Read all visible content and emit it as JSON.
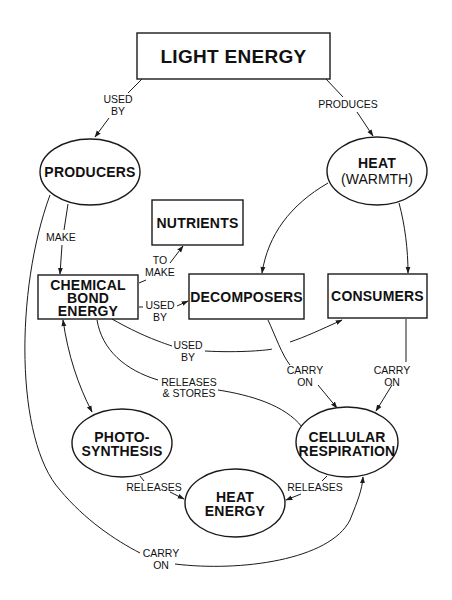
{
  "diagram": {
    "nodes": {
      "light_energy": {
        "lines": [
          "LIGHT ENERGY"
        ],
        "shape": "rect"
      },
      "producers": {
        "lines": [
          "PRODUCERS"
        ],
        "shape": "ellipse"
      },
      "heat_warmth": {
        "lines": [
          "HEAT",
          "(WARMTH)"
        ],
        "shape": "ellipse"
      },
      "nutrients": {
        "lines": [
          "NUTRIENTS"
        ],
        "shape": "rect"
      },
      "chemical_bond_energy": {
        "lines": [
          "CHEMICAL",
          "BOND",
          "ENERGY"
        ],
        "shape": "rect"
      },
      "decomposers": {
        "lines": [
          "DECOMPOSERS"
        ],
        "shape": "rect"
      },
      "consumers": {
        "lines": [
          "CONSUMERS"
        ],
        "shape": "rect"
      },
      "photosynthesis": {
        "lines": [
          "PHOTO-",
          "SYNTHESIS"
        ],
        "shape": "ellipse"
      },
      "cellular_respiration": {
        "lines": [
          "CELLULAR",
          "RESPIRATION"
        ],
        "shape": "ellipse"
      },
      "heat_energy": {
        "lines": [
          "HEAT",
          "ENERGY"
        ],
        "shape": "ellipse"
      }
    },
    "edges": [
      {
        "from": "light_energy",
        "to": "producers",
        "label": [
          "USED",
          "BY"
        ]
      },
      {
        "from": "light_energy",
        "to": "heat_warmth",
        "label": [
          "PRODUCES"
        ]
      },
      {
        "from": "producers",
        "to": "chemical_bond_energy",
        "label": [
          "MAKE"
        ]
      },
      {
        "from": "chemical_bond_energy",
        "to": "nutrients",
        "label": [
          "TO",
          "MAKE"
        ]
      },
      {
        "from": "chemical_bond_energy",
        "to": "decomposers",
        "label": [
          "USED",
          "BY"
        ]
      },
      {
        "from": "chemical_bond_energy",
        "to": "consumers",
        "label": [
          "USED",
          "BY"
        ]
      },
      {
        "from": "heat_warmth",
        "to": "decomposers",
        "label": []
      },
      {
        "from": "heat_warmth",
        "to": "consumers",
        "label": []
      },
      {
        "from": "decomposers",
        "to": "cellular_respiration",
        "label": [
          "CARRY",
          "ON"
        ]
      },
      {
        "from": "consumers",
        "to": "cellular_respiration",
        "label": [
          "CARRY",
          "ON"
        ]
      },
      {
        "from": "cellular_respiration",
        "to": "chemical_bond_energy",
        "label": [
          "RELEASES",
          "& STORES"
        ]
      },
      {
        "from": "chemical_bond_energy",
        "to": "photosynthesis",
        "label": [],
        "bidirectional": true
      },
      {
        "from": "photosynthesis",
        "to": "heat_energy",
        "label": [
          "RELEASES"
        ]
      },
      {
        "from": "cellular_respiration",
        "to": "heat_energy",
        "label": [
          "RELEASES"
        ]
      },
      {
        "from": "producers",
        "to": "cellular_respiration",
        "label": [
          "CARRY",
          "ON"
        ]
      }
    ]
  },
  "labels": {
    "light_energy": "LIGHT ENERGY",
    "producers": "PRODUCERS",
    "heat_warmth_1": "HEAT",
    "heat_warmth_2": "(WARMTH)",
    "nutrients": "NUTRIENTS",
    "cbe_1": "CHEMICAL",
    "cbe_2": "BOND",
    "cbe_3": "ENERGY",
    "decomposers": "DECOMPOSERS",
    "consumers": "CONSUMERS",
    "photo_1": "PHOTO-",
    "photo_2": "SYNTHESIS",
    "cr_1": "CELLULAR",
    "cr_2": "RESPIRATION",
    "he_1": "HEAT",
    "he_2": "ENERGY",
    "e_used_by_1": "USED",
    "e_used_by_2": "BY",
    "e_produces": "PRODUCES",
    "e_make": "MAKE",
    "e_to_make_1": "TO",
    "e_to_make_2": "MAKE",
    "e_used_by_dec_1": "USED",
    "e_used_by_dec_2": "BY",
    "e_used_by_con_1": "USED",
    "e_used_by_con_2": "BY",
    "e_carry_on_dec_1": "CARRY",
    "e_carry_on_dec_2": "ON",
    "e_carry_on_con_1": "CARRY",
    "e_carry_on_con_2": "ON",
    "e_releases_stores_1": "RELEASES",
    "e_releases_stores_2": "& STORES",
    "e_releases_photo": "RELEASES",
    "e_releases_cr": "RELEASES",
    "e_carry_on_bottom_1": "CARRY",
    "e_carry_on_bottom_2": "ON"
  },
  "colors": {
    "stroke": "#1a1a1a",
    "text": "#111111",
    "background": "#ffffff"
  }
}
